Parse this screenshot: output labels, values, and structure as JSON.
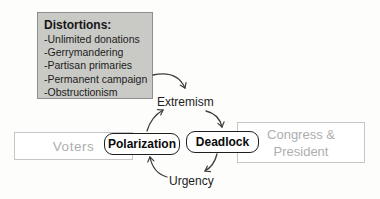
{
  "diagram": {
    "distortions": {
      "title": "Distortions:",
      "items": [
        "-Unlimited donations",
        "-Gerrymandering",
        "-Partisan primaries",
        "-Permanent campaign",
        "-Obstructionism"
      ]
    },
    "actors": {
      "voters": "Voters",
      "congress_line1": "Congress &",
      "congress_line2": "President"
    },
    "cycle": {
      "polarization": "Polarization",
      "deadlock": "Deadlock",
      "extremism": "Extremism",
      "urgency": "Urgency"
    },
    "colors": {
      "distortions_fill": "#c9c9c5",
      "distortions_border": "#8e8e8e",
      "actor_border": "#c6c6c6",
      "actor_text": "#aeaeae",
      "node_border": "#1f1f1f",
      "node_text": "#0a0a0a",
      "arrow": "#3d3d3d",
      "label_text": "#1c1c1c",
      "background": "#fdfdfc"
    }
  }
}
